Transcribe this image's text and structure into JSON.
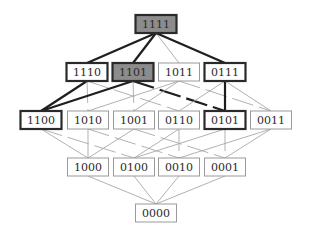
{
  "diagram": {
    "colors": {
      "highlight_fill": "#8c8c8c",
      "bold_stroke": "#1e1e1e",
      "light_stroke": "#a8a8a8",
      "background": "#ffffff"
    },
    "nodes": [
      {
        "id": "1111",
        "label": "1111",
        "row": 0,
        "cx": 156,
        "cy": 24,
        "bold": true,
        "filled": true
      },
      {
        "id": "1110",
        "label": "1110",
        "row": 1,
        "cx": 87,
        "cy": 72,
        "bold": true,
        "filled": false
      },
      {
        "id": "1101",
        "label": "1101",
        "row": 1,
        "cx": 133,
        "cy": 72,
        "bold": true,
        "filled": true
      },
      {
        "id": "1011",
        "label": "1011",
        "row": 1,
        "cx": 179,
        "cy": 72,
        "bold": false,
        "filled": false
      },
      {
        "id": "0111",
        "label": "0111",
        "row": 1,
        "cx": 225,
        "cy": 72,
        "bold": true,
        "filled": false
      },
      {
        "id": "1100",
        "label": "1100",
        "row": 2,
        "cx": 41,
        "cy": 120,
        "bold": true,
        "filled": false
      },
      {
        "id": "1010",
        "label": "1010",
        "row": 2,
        "cx": 88,
        "cy": 120,
        "bold": false,
        "filled": false
      },
      {
        "id": "1001",
        "label": "1001",
        "row": 2,
        "cx": 134,
        "cy": 120,
        "bold": false,
        "filled": false
      },
      {
        "id": "0110",
        "label": "0110",
        "row": 2,
        "cx": 179,
        "cy": 120,
        "bold": false,
        "filled": false
      },
      {
        "id": "0101",
        "label": "0101",
        "row": 2,
        "cx": 225,
        "cy": 120,
        "bold": true,
        "filled": false
      },
      {
        "id": "0011",
        "label": "0011",
        "row": 2,
        "cx": 271,
        "cy": 120,
        "bold": false,
        "filled": false
      },
      {
        "id": "1000",
        "label": "1000",
        "row": 3,
        "cx": 88,
        "cy": 167,
        "bold": false,
        "filled": false
      },
      {
        "id": "0100",
        "label": "0100",
        "row": 3,
        "cx": 134,
        "cy": 167,
        "bold": false,
        "filled": false
      },
      {
        "id": "0010",
        "label": "0010",
        "row": 3,
        "cx": 179,
        "cy": 167,
        "bold": false,
        "filled": false
      },
      {
        "id": "0001",
        "label": "0001",
        "row": 3,
        "cx": 225,
        "cy": 167,
        "bold": false,
        "filled": false
      },
      {
        "id": "0000",
        "label": "0000",
        "row": 4,
        "cx": 156,
        "cy": 213,
        "bold": false,
        "filled": false
      }
    ],
    "edges": [
      {
        "from": "1111",
        "to": "1110",
        "bold": true,
        "dashed": false
      },
      {
        "from": "1111",
        "to": "1101",
        "bold": true,
        "dashed": false
      },
      {
        "from": "1111",
        "to": "1011",
        "bold": false,
        "dashed": false
      },
      {
        "from": "1111",
        "to": "0111",
        "bold": true,
        "dashed": false
      },
      {
        "from": "1110",
        "to": "1100",
        "bold": true,
        "dashed": false
      },
      {
        "from": "1110",
        "to": "1010",
        "bold": false,
        "dashed": true
      },
      {
        "from": "1110",
        "to": "0110",
        "bold": false,
        "dashed": true
      },
      {
        "from": "1101",
        "to": "1100",
        "bold": true,
        "dashed": false
      },
      {
        "from": "1101",
        "to": "1001",
        "bold": false,
        "dashed": true
      },
      {
        "from": "1101",
        "to": "0101",
        "bold": true,
        "dashed": true
      },
      {
        "from": "1011",
        "to": "1010",
        "bold": false,
        "dashed": false
      },
      {
        "from": "1011",
        "to": "1001",
        "bold": false,
        "dashed": false
      },
      {
        "from": "1011",
        "to": "0011",
        "bold": false,
        "dashed": true
      },
      {
        "from": "0111",
        "to": "0110",
        "bold": false,
        "dashed": false
      },
      {
        "from": "0111",
        "to": "0101",
        "bold": true,
        "dashed": false
      },
      {
        "from": "0111",
        "to": "0011",
        "bold": false,
        "dashed": false
      },
      {
        "from": "1100",
        "to": "1000",
        "bold": false,
        "dashed": false
      },
      {
        "from": "1100",
        "to": "0100",
        "bold": false,
        "dashed": true
      },
      {
        "from": "1010",
        "to": "1000",
        "bold": false,
        "dashed": false
      },
      {
        "from": "1010",
        "to": "0010",
        "bold": false,
        "dashed": true
      },
      {
        "from": "1001",
        "to": "1000",
        "bold": false,
        "dashed": false
      },
      {
        "from": "1001",
        "to": "0001",
        "bold": false,
        "dashed": true
      },
      {
        "from": "0110",
        "to": "0100",
        "bold": false,
        "dashed": false
      },
      {
        "from": "0110",
        "to": "0010",
        "bold": false,
        "dashed": true
      },
      {
        "from": "0101",
        "to": "0100",
        "bold": false,
        "dashed": false
      },
      {
        "from": "0101",
        "to": "0001",
        "bold": false,
        "dashed": true
      },
      {
        "from": "0011",
        "to": "0010",
        "bold": false,
        "dashed": false
      },
      {
        "from": "0011",
        "to": "0001",
        "bold": false,
        "dashed": false
      },
      {
        "from": "1000",
        "to": "0000",
        "bold": false,
        "dashed": false
      },
      {
        "from": "0100",
        "to": "0000",
        "bold": false,
        "dashed": false
      },
      {
        "from": "0010",
        "to": "0000",
        "bold": false,
        "dashed": false
      },
      {
        "from": "0001",
        "to": "0000",
        "bold": false,
        "dashed": false
      }
    ],
    "box": {
      "width": 41,
      "height": 18
    }
  }
}
